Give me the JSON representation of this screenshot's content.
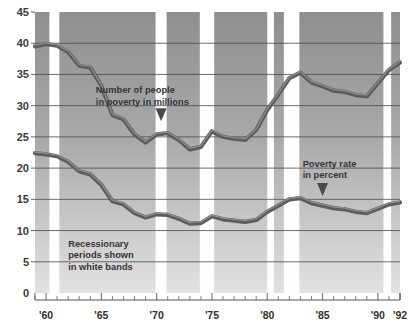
{
  "chart_data": {
    "type": "line",
    "title": "",
    "xlabel": "",
    "ylabel": "",
    "xlim": [
      1959,
      1992
    ],
    "ylim": [
      0,
      45
    ],
    "grid": true,
    "legend_position": "inline-annotations",
    "y_ticks": [
      "0",
      "5",
      "10",
      "15",
      "20",
      "25",
      "30",
      "35",
      "40",
      "45"
    ],
    "y_tick_values": [
      0,
      5,
      10,
      15,
      20,
      25,
      30,
      35,
      40,
      45
    ],
    "x_ticks": [
      "'60",
      "'65",
      "'70",
      "'75",
      "'80",
      "'85",
      "'90",
      "'92"
    ],
    "x_tick_values": [
      1960,
      1965,
      1970,
      1975,
      1980,
      1985,
      1990,
      1992
    ],
    "x_minor_step": 1,
    "x": [
      1959,
      1960,
      1961,
      1962,
      1963,
      1964,
      1965,
      1966,
      1967,
      1968,
      1969,
      1970,
      1971,
      1972,
      1973,
      1974,
      1975,
      1976,
      1977,
      1978,
      1979,
      1980,
      1981,
      1982,
      1983,
      1984,
      1985,
      1986,
      1987,
      1988,
      1989,
      1990,
      1991,
      1992
    ],
    "series": [
      {
        "name": "Number of people in poverty in millions",
        "unit": "millions",
        "values": [
          39.5,
          39.9,
          39.6,
          38.6,
          36.4,
          36.1,
          33.2,
          28.5,
          27.8,
          25.4,
          24.1,
          25.4,
          25.6,
          24.5,
          23.0,
          23.4,
          25.9,
          25.0,
          24.7,
          24.5,
          26.1,
          29.3,
          31.8,
          34.4,
          35.3,
          33.7,
          33.1,
          32.4,
          32.2,
          31.7,
          31.5,
          33.6,
          35.7,
          36.9
        ]
      },
      {
        "name": "Poverty rate in percent",
        "unit": "percent",
        "values": [
          22.4,
          22.2,
          21.9,
          21.0,
          19.5,
          19.0,
          17.3,
          14.7,
          14.2,
          12.8,
          12.1,
          12.6,
          12.5,
          11.9,
          11.1,
          11.2,
          12.3,
          11.8,
          11.6,
          11.4,
          11.7,
          13.0,
          14.0,
          15.0,
          15.2,
          14.4,
          14.0,
          13.6,
          13.4,
          13.0,
          12.8,
          13.5,
          14.2,
          14.5
        ]
      }
    ],
    "recession_bands": [
      {
        "start": 1960.3,
        "end": 1961.2
      },
      {
        "start": 1969.9,
        "end": 1970.9
      },
      {
        "start": 1973.9,
        "end": 1975.2
      },
      {
        "start": 1980.0,
        "end": 1980.6
      },
      {
        "start": 1981.5,
        "end": 1982.9
      },
      {
        "start": 1990.5,
        "end": 1991.2
      }
    ],
    "annotations": [
      {
        "id": "people-annotation",
        "line1": "Number of people",
        "line2": "in poverty in millions",
        "x": 1964.5,
        "y": 32.0,
        "pointer_x": 1970.4,
        "pointer_y": 29.6
      },
      {
        "id": "rate-annotation",
        "line1": "Poverty rate",
        "line2": "in percent",
        "x": 1983.2,
        "y": 20.2,
        "pointer_x": 1985.0,
        "pointer_y": 17.6
      },
      {
        "id": "recession-note",
        "line1": "Recessionary",
        "line2": "periods shown",
        "line3": "in white bands",
        "x": 1962.0,
        "y": 7.4
      }
    ],
    "colors": {
      "band": "#ffffff",
      "plot_background_top": "#9a9a9a",
      "plot_background_bottom": "#d9d9d9",
      "line": "#5c5c5c",
      "gridline": "#4a4a4a",
      "text": "#363636"
    }
  }
}
